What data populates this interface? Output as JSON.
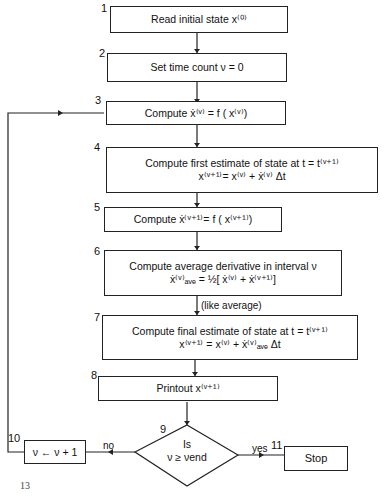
{
  "steps": [
    {
      "num": "1",
      "text": "Read initial state x⁽⁰⁾"
    },
    {
      "num": "2",
      "text": "Set time count ν = 0"
    },
    {
      "num": "3",
      "text": "Compute ẋ⁽ᵛ⁾ = f ( x⁽ᵛ⁾)"
    },
    {
      "num": "4",
      "line1": "Compute first estimate of state at t = t⁽ᵛ⁺¹⁾",
      "line2": "x⁽ᵛ⁺¹⁾= x⁽ᵛ⁾ + ẋ⁽ᵛ⁾ Δt"
    },
    {
      "num": "5",
      "text": "Compute ẋ⁽ᵛ⁺¹⁾= f ( x⁽ᵛ⁺¹⁾)"
    },
    {
      "num": "6",
      "line1": "Compute average derivative in interval ν",
      "line2": "ẋ⁽ᵛ⁾ₐᵥₑ = ½[ ẋ⁽ᵛ⁾ + ẋ⁽ᵛ⁺¹⁾]"
    },
    {
      "num": "7",
      "line1": "Compute final estimate of state at t = t⁽ᵛ⁺¹⁾",
      "line2": "x⁽ᵛ⁺¹⁾ = x⁽ᵛ⁾ + ẋ⁽ᵛ⁾ₐᵥₑ Δt"
    },
    {
      "num": "8",
      "text": "Printout x⁽ᵛ⁺¹⁾"
    },
    {
      "num": "9",
      "line1": "Is",
      "line2": "ν ≥ νend"
    },
    {
      "num": "10",
      "text": "ν ← ν + 1"
    },
    {
      "num": "11",
      "text": "Stop"
    }
  ],
  "annotations": {
    "like_average": "(like average)",
    "no": "no",
    "yes": "yes",
    "page_mark": "13"
  }
}
